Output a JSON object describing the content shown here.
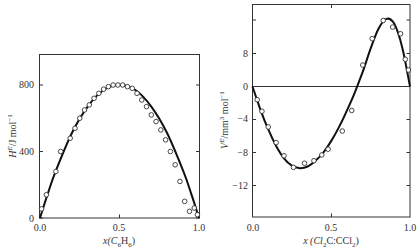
{
  "chart_data": [
    {
      "type": "scatter",
      "title": "",
      "xlabel": "x(C6H6)",
      "ylabel": "H^E / J mol^-1",
      "xlim": [
        0.0,
        1.0
      ],
      "ylim": [
        0,
        1000
      ],
      "x_ticks": [
        "0.0",
        "0.5",
        "1.0"
      ],
      "y_ticks": [
        "0",
        "400",
        "800"
      ],
      "grid": false,
      "legend": null,
      "series": [
        {
          "name": "experimental",
          "marker": "open-circle",
          "x": [
            0.01,
            0.04,
            0.1,
            0.13,
            0.19,
            0.22,
            0.25,
            0.28,
            0.31,
            0.34,
            0.37,
            0.4,
            0.43,
            0.46,
            0.49,
            0.52,
            0.55,
            0.58,
            0.61,
            0.64,
            0.67,
            0.7,
            0.73,
            0.76,
            0.79,
            0.82,
            0.85,
            0.88,
            0.91,
            0.94,
            0.97,
            0.99
          ],
          "y": [
            55,
            140,
            280,
            400,
            480,
            540,
            600,
            650,
            680,
            720,
            750,
            775,
            790,
            800,
            800,
            800,
            790,
            780,
            750,
            710,
            670,
            620,
            580,
            530,
            470,
            400,
            320,
            220,
            100,
            40,
            60,
            20
          ]
        },
        {
          "name": "fit",
          "line": "solid",
          "x": [
            0.0,
            0.05,
            0.1,
            0.2,
            0.3,
            0.4,
            0.5,
            0.6,
            0.7,
            0.8,
            0.9,
            0.95,
            1.0
          ],
          "y": [
            0,
            150,
            285,
            510,
            670,
            770,
            800,
            770,
            670,
            510,
            285,
            150,
            0
          ]
        }
      ]
    },
    {
      "type": "scatter",
      "title": "",
      "xlabel": "x(Cl2C:CCl2)",
      "ylabel": "V^E / mm^3 mol^-1",
      "xlim": [
        0.0,
        1.0
      ],
      "ylim": [
        -16,
        20
      ],
      "x_ticks": [
        "0.0",
        "0.5",
        "1.0"
      ],
      "y_ticks": [
        "8",
        "0",
        "-4",
        "-8",
        "-12"
      ],
      "grid": false,
      "zero_line": true,
      "legend": null,
      "series": [
        {
          "name": "experimental",
          "marker": "open-circle",
          "x": [
            0.03,
            0.06,
            0.1,
            0.15,
            0.2,
            0.26,
            0.33,
            0.39,
            0.44,
            0.48,
            0.57,
            0.63,
            0.7,
            0.76,
            0.83,
            0.89,
            0.94,
            0.97,
            0.99
          ],
          "y": [
            -1.6,
            -3.0,
            -4.9,
            -6.8,
            -8.4,
            -9.8,
            -9.3,
            -9.0,
            -8.3,
            -7.6,
            -5.4,
            -2.9,
            2.6,
            5.8,
            8.0,
            7.2,
            6.4,
            3.3,
            2.0
          ]
        },
        {
          "name": "fit",
          "line": "solid",
          "x": [
            0.0,
            0.05,
            0.1,
            0.15,
            0.2,
            0.25,
            0.3,
            0.35,
            0.4,
            0.45,
            0.5,
            0.55,
            0.6,
            0.65,
            0.7,
            0.75,
            0.8,
            0.85,
            0.9,
            0.95,
            1.0
          ],
          "y": [
            0,
            -2.8,
            -5.2,
            -7.2,
            -8.7,
            -9.6,
            -9.9,
            -9.7,
            -9.0,
            -8.0,
            -6.6,
            -4.9,
            -2.9,
            -0.7,
            1.8,
            4.6,
            7.0,
            8.2,
            7.6,
            4.8,
            0
          ]
        }
      ]
    }
  ],
  "left_chart": {
    "y_tick_labels": [
      "0",
      "400",
      "800"
    ],
    "x_tick_labels": [
      "0.0",
      "0.5",
      "1.0"
    ],
    "ylabel": "H",
    "ylabel_sup": "E",
    "ylabel_rest": "/J mol",
    "ylabel_exp": "−1",
    "xlabel_pre": "x(C",
    "xlabel_sub1": "6",
    "xlabel_mid": "H",
    "xlabel_sub2": "6",
    "xlabel_post": ")"
  },
  "right_chart": {
    "y_tick_labels": [
      "8",
      "0",
      "−4",
      "−8",
      "−12"
    ],
    "x_tick_labels": [
      "0.0",
      "0.5",
      "1.0"
    ],
    "ylabel": "V",
    "ylabel_sup": "E",
    "ylabel_rest": "/mm",
    "ylabel_sup2": "3",
    "ylabel_rest2": " mol",
    "ylabel_exp": "−1",
    "xlabel_pre": "x (Cl",
    "xlabel_sub1": "2",
    "xlabel_mid": "C:CCl",
    "xlabel_sub2": "2",
    "xlabel_post": ")"
  }
}
